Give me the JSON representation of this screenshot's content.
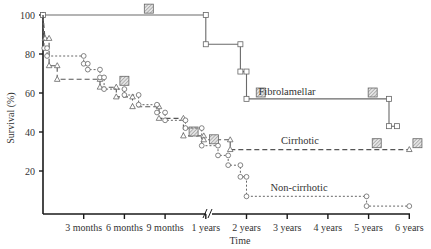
{
  "chart_data": {
    "type": "line",
    "title": "",
    "xlabel": "Time",
    "ylabel": "Survival (%)",
    "ylim": [
      0,
      100
    ],
    "y_ticks": [
      20,
      40,
      60,
      80,
      100
    ],
    "x_tick_labels": [
      "3 months",
      "6 months",
      "9 months",
      "1 years",
      "2 years",
      "3 years",
      "4 years",
      "5 years",
      "6 years"
    ],
    "x_tick_index": [
      1,
      2,
      3,
      4,
      5,
      6,
      7,
      8,
      9
    ],
    "axis_break_after": "1 years",
    "x_unit_note": "x index: 0=start, 1=3mo, 2=6mo, 3=9mo, 4=1yr, 5=2yr, 6=3yr, 7=4yr, 8=5yr, 9=6yr",
    "grid": false,
    "legend": "inline labels",
    "series": [
      {
        "name": "Fibrolamellar",
        "style": "solid",
        "marker": "square",
        "points": [
          [
            0.0,
            100
          ],
          [
            4.0,
            100
          ],
          [
            4.0,
            85
          ],
          [
            4.85,
            85
          ],
          [
            4.85,
            71
          ],
          [
            5.0,
            71
          ],
          [
            5.0,
            57
          ],
          [
            8.5,
            57
          ],
          [
            8.5,
            43
          ],
          [
            8.7,
            43
          ]
        ],
        "censored": [
          [
            2.6,
            103
          ],
          [
            5.35,
            60
          ],
          [
            8.1,
            60
          ]
        ]
      },
      {
        "name": "Cirrhotic",
        "style": "dashed",
        "marker": "triangle",
        "points": [
          [
            0.0,
            100
          ],
          [
            0.05,
            88
          ],
          [
            0.15,
            88
          ],
          [
            0.15,
            74
          ],
          [
            0.35,
            74
          ],
          [
            0.35,
            67
          ],
          [
            1.4,
            67
          ],
          [
            1.4,
            63
          ],
          [
            1.8,
            63
          ],
          [
            1.8,
            58
          ],
          [
            2.2,
            58
          ],
          [
            2.2,
            53
          ],
          [
            2.85,
            53
          ],
          [
            2.85,
            47
          ],
          [
            3.45,
            47
          ],
          [
            3.45,
            38
          ],
          [
            3.95,
            38
          ],
          [
            3.95,
            36
          ],
          [
            4.6,
            36
          ],
          [
            4.6,
            31
          ],
          [
            9.0,
            31
          ]
        ],
        "censored": [
          [
            2.0,
            66
          ],
          [
            3.7,
            40
          ],
          [
            4.2,
            36
          ],
          [
            8.2,
            34
          ],
          [
            9.2,
            34
          ]
        ]
      },
      {
        "name": "Non-cirrhotic",
        "style": "dotted",
        "marker": "circle",
        "points": [
          [
            0.0,
            100
          ],
          [
            0.03,
            83
          ],
          [
            0.1,
            83
          ],
          [
            0.1,
            79
          ],
          [
            1.0,
            79
          ],
          [
            1.0,
            75
          ],
          [
            1.1,
            75
          ],
          [
            1.1,
            72
          ],
          [
            1.4,
            72
          ],
          [
            1.4,
            68
          ],
          [
            1.5,
            68
          ],
          [
            1.5,
            62
          ],
          [
            2.0,
            62
          ],
          [
            2.0,
            59
          ],
          [
            2.35,
            59
          ],
          [
            2.35,
            54
          ],
          [
            2.8,
            54
          ],
          [
            2.8,
            50
          ],
          [
            3.0,
            50
          ],
          [
            3.0,
            46
          ],
          [
            3.5,
            46
          ],
          [
            3.5,
            42
          ],
          [
            3.9,
            42
          ],
          [
            3.9,
            33
          ],
          [
            4.3,
            33
          ],
          [
            4.3,
            28
          ],
          [
            4.55,
            28
          ],
          [
            4.55,
            23
          ],
          [
            4.85,
            23
          ],
          [
            4.85,
            17
          ],
          [
            5.0,
            17
          ],
          [
            5.0,
            7
          ],
          [
            7.95,
            7
          ],
          [
            7.95,
            2
          ],
          [
            9.0,
            2
          ]
        ]
      }
    ],
    "annotations": [
      "Fibrolamellar",
      "Cirrhotic",
      "Non-cirrhotic"
    ]
  }
}
